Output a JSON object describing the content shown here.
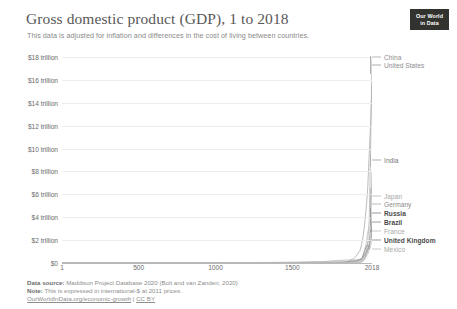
{
  "header": {
    "title": "Gross domestic product (GDP), 1 to 2018",
    "subtitle": "This data is adjusted for inflation and differences in the cost of living between countries."
  },
  "logo": {
    "line1": "Our World",
    "line2": "in Data"
  },
  "footer": {
    "source_label": "Data source:",
    "source_text": "Maddison Project Database 2020 (Bolt and van Zanden, 2020)",
    "note_label": "Note:",
    "note_text": "This is expressed in international-$ at 2011 prices.",
    "link_text": "OurWorldInData.org/economic-growth",
    "separator": " | ",
    "license_text": "CC BY"
  },
  "chart_data": {
    "type": "line",
    "title": "Gross domestic product (GDP), 1 to 2018",
    "subtitle": "This data is adjusted for inflation and differences in the cost of living between countries.",
    "xlabel": "",
    "ylabel": "",
    "xlim": [
      1,
      2018
    ],
    "ylim": [
      0,
      18000000000000
    ],
    "grid": true,
    "legend_position": "right-inline",
    "x_ticks": [
      {
        "value": 1,
        "label": "1"
      },
      {
        "value": 500,
        "label": "500"
      },
      {
        "value": 1000,
        "label": "1000"
      },
      {
        "value": 1500,
        "label": "1500"
      },
      {
        "value": 2018,
        "label": "2018"
      }
    ],
    "y_ticks": [
      {
        "value": 0,
        "label": "$0"
      },
      {
        "value": 2000000000000,
        "label": "$2 trillion"
      },
      {
        "value": 4000000000000,
        "label": "$4 trillion"
      },
      {
        "value": 6000000000000,
        "label": "$6 trillion"
      },
      {
        "value": 8000000000000,
        "label": "$8 trillion"
      },
      {
        "value": 10000000000000,
        "label": "$10 trillion"
      },
      {
        "value": 12000000000000,
        "label": "$12 trillion"
      },
      {
        "value": 14000000000000,
        "label": "$14 trillion"
      },
      {
        "value": 16000000000000,
        "label": "$16 trillion"
      },
      {
        "value": 18000000000000,
        "label": "$18 trillion"
      }
    ],
    "x": [
      1,
      1000,
      1500,
      1600,
      1700,
      1800,
      1850,
      1900,
      1920,
      1940,
      1950,
      1960,
      1970,
      1980,
      1990,
      2000,
      2010,
      2018
    ],
    "series": [
      {
        "name": "China",
        "color": "#b8b8b8",
        "label_color": "#8c8c8c",
        "label_bold": false,
        "label_y": 57,
        "values": [
          26000000000,
          27000000000,
          62000000000,
          96000000000,
          120000000000,
          230000000000,
          250000000000,
          260000000000,
          280000000000,
          300000000000,
          310000000000,
          450000000000,
          650000000000,
          950000000000,
          1800000000000,
          3700000000000,
          11000000000000,
          17900000000000
        ]
      },
      {
        "name": "United States",
        "color": "#b0b0b0",
        "label_color": "#8c8c8c",
        "label_bold": false,
        "label_y": 65,
        "values": [
          1000000000,
          1200000000,
          1500000000,
          2000000000,
          3000000000,
          20000000000,
          70000000000,
          400000000000,
          700000000000,
          1100000000000,
          1600000000000,
          2300000000000,
          3400000000000,
          4800000000000,
          6500000000000,
          9500000000000,
          12500000000000,
          15700000000000
        ]
      },
      {
        "name": "India",
        "color": "#b0b0b0",
        "label_color": "#777777",
        "label_bold": false,
        "label_y": 160,
        "values": [
          25000000000,
          27000000000,
          50000000000,
          63000000000,
          80000000000,
          110000000000,
          120000000000,
          160000000000,
          180000000000,
          210000000000,
          230000000000,
          320000000000,
          420000000000,
          580000000000,
          950000000000,
          1600000000000,
          3800000000000,
          7900000000000
        ]
      },
      {
        "name": "Japan",
        "color": "#c4c4c4",
        "label_color": "#a8a8a8",
        "label_bold": false,
        "label_y": 196,
        "values": [
          1200000000,
          2500000000,
          6000000000,
          10000000000,
          18000000000,
          26000000000,
          30000000000,
          60000000000,
          110000000000,
          180000000000,
          160000000000,
          420000000000,
          1100000000000,
          1700000000000,
          2700000000000,
          3100000000000,
          3300000000000,
          4400000000000
        ]
      },
      {
        "name": "Germany",
        "color": "#bcbcbc",
        "label_color": "#8a8a8a",
        "label_bold": false,
        "label_y": 204,
        "values": [
          1500000000,
          2500000000,
          6000000000,
          9000000000,
          14000000000,
          26000000000,
          45000000000,
          140000000000,
          190000000000,
          330000000000,
          250000000000,
          620000000000,
          950000000000,
          1300000000000,
          1700000000000,
          2100000000000,
          2500000000000,
          3900000000000
        ]
      },
      {
        "name": "Russia",
        "color": "#999999",
        "label_color": "#4a4a4a",
        "label_bold": true,
        "label_y": 213,
        "values": [
          900000000,
          2000000000,
          6000000000,
          9000000000,
          14000000000,
          30000000000,
          50000000000,
          130000000000,
          110000000000,
          340000000000,
          320000000000,
          680000000000,
          1100000000000,
          1400000000000,
          1600000000000,
          1200000000000,
          2200000000000,
          3500000000000
        ]
      },
      {
        "name": "Brazil",
        "color": "#9e9e9e",
        "label_color": "#4a4a4a",
        "label_bold": true,
        "label_y": 222,
        "values": [
          500000000,
          700000000,
          1200000000,
          1600000000,
          3000000000,
          6000000000,
          11000000000,
          26000000000,
          45000000000,
          75000000000,
          110000000000,
          200000000000,
          400000000000,
          900000000000,
          1100000000000,
          1500000000000,
          2400000000000,
          3100000000000
        ]
      },
      {
        "name": "France",
        "color": "#c8c8c8",
        "label_color": "#aaaaaa",
        "label_bold": false,
        "label_y": 231,
        "values": [
          2000000000,
          3000000000,
          7000000000,
          11000000000,
          18000000000,
          32000000000,
          55000000000,
          110000000000,
          140000000000,
          180000000000,
          220000000000,
          410000000000,
          700000000000,
          1000000000000,
          1300000000000,
          1600000000000,
          2000000000000,
          2700000000000
        ]
      },
      {
        "name": "United Kingdom",
        "color": "#9e9e9e",
        "label_color": "#4a4a4a",
        "label_bold": true,
        "label_y": 240,
        "values": [
          800000000,
          1500000000,
          3000000000,
          6000000000,
          11000000000,
          35000000000,
          80000000000,
          180000000000,
          220000000000,
          330000000000,
          380000000000,
          530000000000,
          720000000000,
          900000000000,
          1200000000000,
          1600000000000,
          2000000000000,
          2600000000000
        ]
      },
      {
        "name": "Mexico",
        "color": "#c8c8c8",
        "label_color": "#a8a8a8",
        "label_bold": false,
        "label_y": 249,
        "values": [
          500000000,
          700000000,
          1500000000,
          1800000000,
          3000000000,
          6000000000,
          8000000000,
          20000000000,
          30000000000,
          45000000000,
          75000000000,
          150000000000,
          300000000000,
          600000000000,
          750000000000,
          1100000000000,
          1500000000000,
          2200000000000
        ]
      }
    ]
  }
}
